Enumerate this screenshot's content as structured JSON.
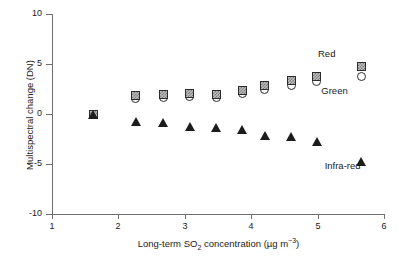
{
  "chart_data": {
    "type": "scatter",
    "title": "",
    "xlabel": "Long-term SO2 concentration (ug m-3)",
    "xlabel_parts": {
      "pre": "Long-term SO",
      "sub": "2",
      "mid": " concentration (µg m",
      "sup": "−3",
      "post": ")"
    },
    "ylabel": "Multispectral change (DN)",
    "xlim": [
      1,
      6
    ],
    "ylim": [
      -10,
      10
    ],
    "xticks": [
      1,
      2,
      3,
      4,
      5,
      6
    ],
    "xtick_labels": [
      "1",
      "2",
      "3",
      "4",
      "5",
      "6"
    ],
    "yticks": [
      -10,
      -5,
      0,
      5,
      10
    ],
    "ytick_labels": [
      "-10",
      "-5",
      "0",
      "5",
      "10"
    ],
    "grid": false,
    "legend_position": "inline-annotations",
    "series": [
      {
        "name": "Red",
        "marker": "hatched-square",
        "marker_color": "#8a8a8a",
        "x": [
          1.62,
          2.26,
          2.67,
          3.07,
          3.47,
          3.86,
          4.2,
          4.6,
          4.98,
          5.65
        ],
        "y": [
          0.0,
          1.9,
          2.0,
          2.1,
          2.0,
          2.4,
          2.9,
          3.4,
          3.8,
          4.8
        ]
      },
      {
        "name": "Green",
        "marker": "open-circle",
        "marker_color": "#ffffff",
        "x": [
          1.62,
          2.26,
          2.67,
          3.07,
          3.47,
          3.86,
          4.2,
          4.6,
          4.98,
          5.65
        ],
        "y": [
          0.0,
          1.6,
          1.7,
          1.8,
          1.7,
          2.1,
          2.5,
          2.9,
          3.3,
          3.8
        ]
      },
      {
        "name": "Infra-red",
        "marker": "filled-triangle",
        "marker_color": "#1c1c1c",
        "x": [
          1.62,
          2.26,
          2.67,
          3.07,
          3.47,
          3.86,
          4.2,
          4.6,
          4.98,
          5.65
        ],
        "y": [
          0.0,
          -0.7,
          -0.8,
          -1.2,
          -1.3,
          -1.5,
          -2.1,
          -2.2,
          -2.7,
          -4.7
        ]
      }
    ],
    "annotations": [
      {
        "text": "Red",
        "x": 5.0,
        "y": 6.0
      },
      {
        "text": "Green",
        "x": 5.05,
        "y": 2.3
      },
      {
        "text": "Infra-red",
        "x": 5.1,
        "y": -5.2
      }
    ]
  }
}
